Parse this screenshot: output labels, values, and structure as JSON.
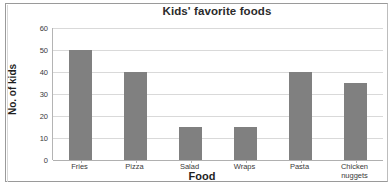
{
  "chart_data": {
    "type": "bar",
    "title": "Kids' favorite foods",
    "xlabel": "Food",
    "ylabel": "No. of kids",
    "categories": [
      "Fries",
      "Pizza",
      "Salad",
      "Wraps",
      "Pasta",
      "Chicken nuggets"
    ],
    "values": [
      50,
      40,
      15,
      15,
      40,
      35
    ],
    "ylim": [
      0,
      60
    ],
    "ytick_labels": [
      "60",
      "50",
      "40",
      "30",
      "20",
      "10",
      "0"
    ],
    "ytick_values": [
      60,
      50,
      40,
      30,
      20,
      10,
      0
    ],
    "ytick_step": 10,
    "grid": "horizontal",
    "legend": "none",
    "bar_color": "#808080",
    "grid_color": "#d9d9d9",
    "axis_color": "#b0b0b0",
    "title_color": "#2b2b2b"
  }
}
